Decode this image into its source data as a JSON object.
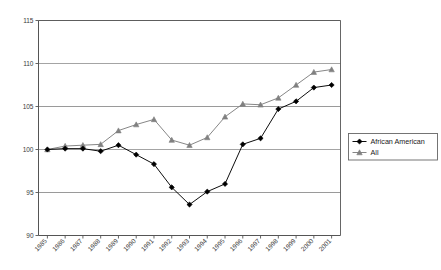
{
  "chart_data": {
    "type": "line",
    "title": "",
    "subtitle": "",
    "xlabel": "",
    "ylabel": "",
    "grid": true,
    "legend_position": "right",
    "xlim": [
      "1985",
      "2001"
    ],
    "ylim": [
      90,
      115
    ],
    "yticks": [
      90,
      95,
      100,
      105,
      110,
      115
    ],
    "categories": [
      "1985",
      "1986",
      "1987",
      "1988",
      "1989",
      "1990",
      "1991",
      "1992",
      "1993",
      "1994",
      "1995",
      "1996",
      "1997",
      "1998",
      "1999",
      "2000",
      "2001"
    ],
    "series": [
      {
        "name": "African American",
        "marker": "diamond",
        "color": "#000000",
        "values": [
          100.0,
          100.1,
          100.1,
          99.8,
          100.5,
          99.4,
          98.3,
          95.6,
          93.6,
          95.1,
          96.0,
          100.6,
          101.3,
          104.7,
          105.6,
          107.2,
          107.5
        ]
      },
      {
        "name": "All",
        "marker": "triangle",
        "color": "#808080",
        "values": [
          100.0,
          100.4,
          100.5,
          100.6,
          102.2,
          102.9,
          103.5,
          101.1,
          100.5,
          101.4,
          103.8,
          105.3,
          105.2,
          106.0,
          107.5,
          109.0,
          109.3
        ]
      }
    ]
  },
  "legend": {
    "entries": [
      {
        "label": "African American",
        "marker": "diamond"
      },
      {
        "label": "All",
        "marker": "triangle"
      }
    ]
  },
  "axis": {
    "y_tick_labels": [
      "115",
      "110",
      "105",
      "100",
      "95",
      "90"
    ],
    "x_tick_labels": [
      "1985",
      "1986",
      "1987",
      "1988",
      "1989",
      "1990",
      "1991",
      "1992",
      "1993",
      "1994",
      "1995",
      "1996",
      "1997",
      "1998",
      "1999",
      "2000",
      "2001"
    ]
  },
  "colors": {
    "series_african_american": "#000000",
    "series_all": "#808080",
    "gridline": "#9a9a9a",
    "axis": "#555555",
    "background": "#ffffff"
  }
}
